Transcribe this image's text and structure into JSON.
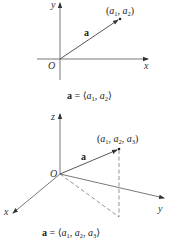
{
  "figure_2d": {
    "axis_labels": {
      "x": "x",
      "y": "y",
      "origin": "O"
    },
    "vector_label": "a",
    "point_label": {
      "open": "(",
      "a": "a",
      "s1": "1",
      "sep": ", ",
      "s2": "2",
      "close": ")"
    },
    "caption": {
      "lhs": "a",
      "eq": " = ⟨",
      "a": "a",
      "s1": "1",
      "sep": ", ",
      "s2": "2",
      "close": "⟩"
    }
  },
  "figure_3d": {
    "axis_labels": {
      "x": "x",
      "y": "y",
      "z": "z",
      "origin": "O"
    },
    "vector_label": "a",
    "point_label": {
      "open": "(",
      "a": "a",
      "s1": "1",
      "s2": "2",
      "s3": "3",
      "sep": ", ",
      "close": ")"
    },
    "caption": {
      "lhs": "a",
      "eq": " = ⟨",
      "a": "a",
      "s1": "1",
      "s2": "2",
      "s3": "3",
      "sep": ", ",
      "close": "⟩"
    }
  },
  "colors": {
    "line": "#444444",
    "text": "#222222",
    "background": "#ffffff"
  }
}
